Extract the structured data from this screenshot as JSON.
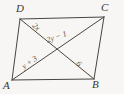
{
  "figure": {
    "type": "geometry-diagram",
    "shape": "parallelogram-with-diagonals",
    "background_color": "#f7f6f4",
    "stroke_color": "#4a4540",
    "label_color": "#3a3632",
    "segment_label_color": "#5d5650",
    "vertices": [
      {
        "id": "D",
        "label": "D",
        "x": 20,
        "y": 19
      },
      {
        "id": "C",
        "label": "C",
        "x": 104,
        "y": 17
      },
      {
        "id": "B",
        "label": "B",
        "x": 94,
        "y": 79
      },
      {
        "id": "A",
        "label": "A",
        "x": 12,
        "y": 80
      }
    ],
    "intersection": {
      "id": "X",
      "x": 57,
      "y": 50
    },
    "sides": [
      {
        "name": "DC",
        "from": "D",
        "to": "C"
      },
      {
        "name": "CB",
        "from": "C",
        "to": "B"
      },
      {
        "name": "BA",
        "from": "B",
        "to": "A"
      },
      {
        "name": "AD",
        "from": "A",
        "to": "D"
      }
    ],
    "diagonals": [
      {
        "name": "AC",
        "from": "A",
        "to": "C"
      },
      {
        "name": "DB",
        "from": "D",
        "to": "B"
      }
    ],
    "segment_labels": [
      {
        "segment": "DX",
        "text": "2x"
      },
      {
        "segment": "XC",
        "text": "2y − 1"
      },
      {
        "segment": "AX",
        "text": "y + 3"
      },
      {
        "segment": "XB",
        "text": "6"
      }
    ]
  }
}
